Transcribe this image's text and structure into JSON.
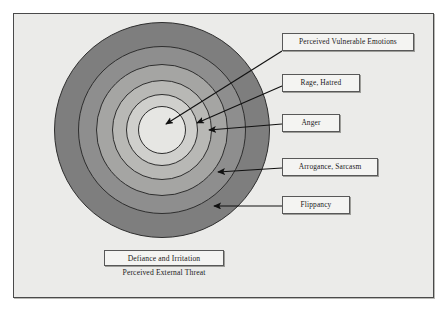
{
  "diagram": {
    "background_color": "#ebebe9",
    "frame_border_color": "#4a4a4a",
    "rings": [
      {
        "id": "ring-outer",
        "label": "Defiance and Irritation",
        "fill": "#7e7e7e",
        "cx": 162,
        "cy": 130,
        "r": 108
      },
      {
        "id": "ring-4",
        "label": "Flippancy",
        "fill": "#8e8e8e",
        "cx": 162,
        "cy": 130,
        "r": 84
      },
      {
        "id": "ring-3",
        "label": "Arrogance, Sarcasm",
        "fill": "#a5a5a3",
        "cx": 162,
        "cy": 130,
        "r": 66
      },
      {
        "id": "ring-2",
        "label": "Anger",
        "fill": "#b8b8b5",
        "cx": 162,
        "cy": 130,
        "r": 50
      },
      {
        "id": "ring-1",
        "label": "Rage, Hatred",
        "fill": "#cfcfcc",
        "cx": 162,
        "cy": 130,
        "r": 36
      },
      {
        "id": "ring-core",
        "label": "Perceived Vulnerable Emotions",
        "fill": "#e6e6e3",
        "cx": 162,
        "cy": 130,
        "r": 24
      }
    ],
    "callouts": [
      {
        "id": "callout-perceived-vulnerable-emotions",
        "text": "Perceived Vulnerable Emotions",
        "box": {
          "x": 282,
          "y": 33,
          "w": 132,
          "h": 18
        },
        "arrow": {
          "x1": 282,
          "y1": 51,
          "x2": 166,
          "y2": 124
        }
      },
      {
        "id": "callout-rage-hatred",
        "text": "Rage, Hatred",
        "box": {
          "x": 282,
          "y": 74,
          "w": 78,
          "h": 18
        },
        "arrow": {
          "x1": 282,
          "y1": 86,
          "x2": 197,
          "y2": 123
        }
      },
      {
        "id": "callout-anger",
        "text": "Anger",
        "box": {
          "x": 282,
          "y": 114,
          "w": 58,
          "h": 18
        },
        "arrow": {
          "x1": 282,
          "y1": 124,
          "x2": 209,
          "y2": 130
        }
      },
      {
        "id": "callout-arrogance-sarcasm",
        "text": "Arrogance, Sarcasm",
        "box": {
          "x": 282,
          "y": 158,
          "w": 96,
          "h": 18
        },
        "arrow": {
          "x1": 282,
          "y1": 168,
          "x2": 218,
          "y2": 172
        }
      },
      {
        "id": "callout-flippancy",
        "text": "Flippancy",
        "box": {
          "x": 282,
          "y": 196,
          "w": 68,
          "h": 18
        },
        "arrow": {
          "x1": 282,
          "y1": 206,
          "x2": 214,
          "y2": 206
        }
      }
    ],
    "bottom_box": {
      "text": "Defiance and Irritation",
      "box": {
        "x": 104,
        "y": 250,
        "w": 120,
        "h": 16
      }
    },
    "bottom_caption": {
      "text": "Perceived External Threat",
      "box": {
        "x": 98,
        "y": 268,
        "w": 132,
        "h": 12
      }
    }
  }
}
